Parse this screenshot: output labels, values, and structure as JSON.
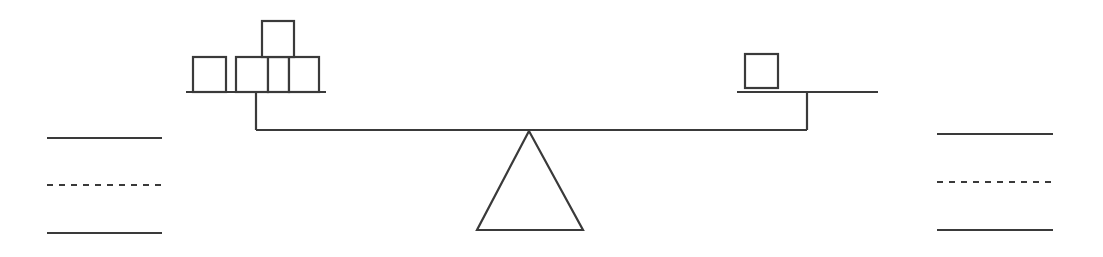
{
  "diagram": {
    "type": "balance-scale",
    "stroke_color": "#3a3a3a",
    "background": "#ffffff",
    "left_pan": {
      "label": "left pan",
      "block_count": 5,
      "line": {
        "x1": 186,
        "x2": 326,
        "y": 92
      },
      "post": {
        "x": 256,
        "y1": 92,
        "y2": 130
      },
      "blocks": [
        {
          "x": 193,
          "y": 57,
          "w": 33,
          "h": 35
        },
        {
          "x": 236,
          "y": 57,
          "w": 32,
          "h": 35
        },
        {
          "x": 268,
          "y": 57,
          "w": 21,
          "h": 35
        },
        {
          "x": 289,
          "y": 57,
          "w": 30,
          "h": 35
        },
        {
          "x": 262,
          "y": 21,
          "w": 32,
          "h": 36
        }
      ]
    },
    "right_pan": {
      "label": "right pan",
      "block_count": 1,
      "line": {
        "x1": 737,
        "x2": 878,
        "y": 92
      },
      "post": {
        "x": 807,
        "y1": 92,
        "y2": 130
      },
      "blocks": [
        {
          "x": 745,
          "y": 54,
          "w": 33,
          "h": 34
        }
      ]
    },
    "beam": {
      "x1": 256,
      "x2": 807,
      "y": 130
    },
    "fulcrum": {
      "apex": [
        529,
        131
      ],
      "base_left": [
        477,
        230
      ],
      "base_right": [
        583,
        230
      ]
    },
    "left_answer_lines": {
      "x1": 47,
      "x2": 162,
      "lines": [
        {
          "style": "solid",
          "y": 138
        },
        {
          "style": "dashed",
          "y": 185
        },
        {
          "style": "solid",
          "y": 233
        }
      ]
    },
    "right_answer_lines": {
      "x1": 937,
      "x2": 1053,
      "lines": [
        {
          "style": "solid",
          "y": 134
        },
        {
          "style": "dashed",
          "y": 182
        },
        {
          "style": "solid",
          "y": 230
        }
      ]
    }
  }
}
